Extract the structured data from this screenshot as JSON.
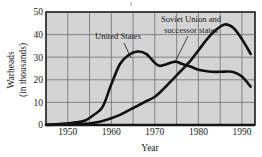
{
  "chart_data": {
    "type": "line",
    "title": "",
    "xlabel": "Year",
    "ylabel": "Warheads\n(in thousands)",
    "ylabel_line1": "Warheads",
    "ylabel_line2": "(in thousands)",
    "xlim": [
      1945,
      1993
    ],
    "ylim": [
      0,
      50
    ],
    "xticks": [
      1950,
      1960,
      1970,
      1980,
      1990
    ],
    "xtick_labels": [
      "1950",
      "1960",
      "1970",
      "1980",
      "1990"
    ],
    "yticks": [
      0,
      10,
      20,
      30,
      40,
      50
    ],
    "ytick_labels": [
      "0",
      "10",
      "20",
      "30",
      "40",
      "50"
    ],
    "grid": true,
    "grid_x_step": 5,
    "grid_y_step": 10,
    "plot_background": "#d4d4d4",
    "line_color": "#111111",
    "legend_position": "inline-annotations",
    "series": [
      {
        "name": "United States",
        "label": "United States",
        "x": [
          1945,
          1948,
          1950,
          1952,
          1954,
          1956,
          1958,
          1960,
          1962,
          1964,
          1966,
          1968,
          1970,
          1971,
          1972,
          1974,
          1975,
          1976,
          1978,
          1980,
          1982,
          1984,
          1986,
          1988,
          1990,
          1992
        ],
        "values": [
          0.2,
          0.4,
          0.8,
          1.2,
          2.0,
          4.5,
          8.0,
          18.0,
          27.0,
          31.0,
          32.5,
          31.5,
          27.5,
          26.2,
          26.5,
          27.8,
          28.0,
          27.2,
          26.0,
          24.5,
          23.8,
          23.5,
          23.6,
          23.5,
          21.5,
          17.0
        ]
      },
      {
        "name": "Soviet Union and successor states",
        "label": "Soviet Union and successor states",
        "label_line1": "Soviet Union and",
        "label_line2": "successor states",
        "x": [
          1945,
          1950,
          1954,
          1956,
          1958,
          1960,
          1962,
          1964,
          1966,
          1968,
          1970,
          1972,
          1974,
          1976,
          1978,
          1980,
          1982,
          1984,
          1986,
          1988,
          1990,
          1992
        ],
        "values": [
          0.0,
          0.2,
          0.5,
          1.0,
          1.8,
          3.0,
          4.5,
          6.5,
          8.5,
          10.5,
          12.5,
          16.0,
          20.0,
          24.0,
          28.0,
          33.0,
          38.0,
          42.0,
          44.5,
          43.0,
          38.0,
          31.5
        ]
      }
    ],
    "annotations": [
      {
        "name": "united-states-annotation",
        "text": "United States",
        "text_x": 118,
        "text_y": 39,
        "leader_from_x": 124,
        "leader_from_y": 43,
        "leader_to_x": 131,
        "leader_to_y": 58
      },
      {
        "name": "soviet-union-annotation",
        "text_line1": "Soviet Union and",
        "text_line2": "successor states",
        "text_x": 191,
        "text_y": 20,
        "leader_from_x": 188,
        "leader_from_y": 36,
        "leader_to_x": 176,
        "leader_to_y": 60
      }
    ]
  }
}
